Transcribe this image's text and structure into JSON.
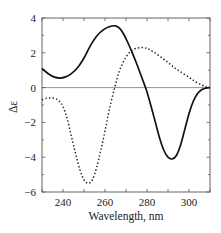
{
  "chart_data": {
    "type": "line",
    "title": "",
    "xlabel": "Wavelength, nm",
    "ylabel": "Δε",
    "xlim": [
      230,
      310
    ],
    "ylim": [
      -6,
      4
    ],
    "xticks": [
      240,
      260,
      280,
      300
    ],
    "xticks_minor": [
      230,
      240,
      250,
      260,
      270,
      280,
      290,
      300,
      310
    ],
    "yticks": [
      4,
      2,
      0,
      -2,
      -4,
      -6
    ],
    "ytick_labels": [
      "4",
      "2",
      "0",
      "−2",
      "−4",
      "−6"
    ],
    "grid": false,
    "legend": null,
    "zero_line": true,
    "series": [
      {
        "name": "solid",
        "style": "solid",
        "color": "#111111",
        "x": [
          230,
          233,
          236,
          238.5,
          241,
          244,
          247,
          250,
          253,
          256,
          259,
          262,
          265,
          267,
          269,
          271,
          273,
          275,
          277,
          279,
          280,
          282,
          284,
          286,
          288,
          290,
          292,
          294,
          296,
          298,
          300,
          302,
          304,
          306,
          308,
          310
        ],
        "y": [
          1.1,
          0.8,
          0.6,
          0.55,
          0.6,
          0.8,
          1.15,
          1.7,
          2.4,
          2.95,
          3.3,
          3.5,
          3.55,
          3.4,
          3.05,
          2.55,
          2.0,
          1.4,
          0.75,
          0.1,
          -0.25,
          -1.1,
          -2.0,
          -2.9,
          -3.6,
          -4.0,
          -4.1,
          -3.9,
          -3.3,
          -2.4,
          -1.5,
          -0.8,
          -0.35,
          -0.12,
          -0.03,
          0.0
        ]
      },
      {
        "name": "dotted",
        "style": "dotted",
        "color": "#111111",
        "x": [
          230,
          232,
          234,
          236,
          238,
          240,
          242,
          244,
          246,
          248,
          250,
          252,
          254,
          256,
          258,
          260,
          262,
          264.6,
          267,
          270,
          273,
          276.8,
          280,
          283,
          286.5,
          290,
          293,
          296,
          300,
          303,
          306,
          308,
          310
        ],
        "y": [
          -0.7,
          -0.62,
          -0.6,
          -0.62,
          -0.75,
          -1.1,
          -1.8,
          -2.8,
          -3.8,
          -4.7,
          -5.3,
          -5.5,
          -5.3,
          -4.6,
          -3.6,
          -2.5,
          -1.3,
          0.0,
          1.0,
          1.75,
          2.15,
          2.3,
          2.25,
          2.05,
          1.76,
          1.45,
          1.15,
          0.9,
          0.6,
          0.35,
          0.15,
          0.05,
          0.0
        ]
      }
    ]
  }
}
